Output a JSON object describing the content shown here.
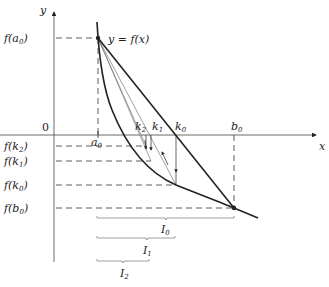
{
  "diagram": {
    "axes": {
      "x_label": "x",
      "y_label": "y",
      "origin_label": "0"
    },
    "curve_label": "y = f(x)",
    "x_ticks": [
      {
        "name": "a",
        "sub": "0"
      },
      {
        "name": "k",
        "sub": "2"
      },
      {
        "name": "k",
        "sub": "1"
      },
      {
        "name": "k",
        "sub": "0"
      },
      {
        "name": "b",
        "sub": "0"
      }
    ],
    "y_ticks": [
      {
        "text": "f(a",
        "sub": "0",
        "close": ")"
      },
      {
        "text": "f(k",
        "sub": "2",
        "close": ")"
      },
      {
        "text": "f(k",
        "sub": "1",
        "close": ")"
      },
      {
        "text": "f(k",
        "sub": "0",
        "close": ")"
      },
      {
        "text": "f(b",
        "sub": "0",
        "close": ")"
      }
    ],
    "intervals": [
      {
        "name": "I",
        "sub": "0"
      },
      {
        "name": "I",
        "sub": "1"
      },
      {
        "name": "I",
        "sub": "2"
      }
    ],
    "colors": {
      "ink": "#222222",
      "light_ink": "#777777"
    }
  }
}
